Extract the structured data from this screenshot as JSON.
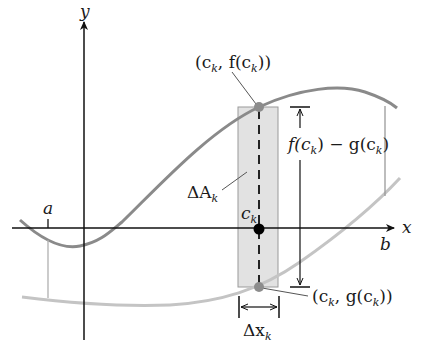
{
  "diagram": {
    "colors": {
      "axis": "#111111",
      "curve_f": "#8a8a8a",
      "curve_g": "#c4c4c4",
      "rect_fill": "#e2e2e2",
      "rect_stroke": "#9a9a9a",
      "point_gray": "#8c8c8c",
      "point_black": "#000000"
    },
    "axes": {
      "x_label": "x",
      "y_label": "y"
    },
    "labels": {
      "a": "a",
      "b": "b",
      "ck": "c",
      "ck_sub": "k",
      "delta_A": "ΔA",
      "delta_A_sub": "k",
      "delta_x": "Δx",
      "delta_x_sub": "k",
      "top_point_pre": "(c",
      "top_point_sub": "k",
      "top_point_mid": ", f(c",
      "top_point_sub2": "k",
      "top_point_post": "))",
      "bottom_point_pre": "(c",
      "bottom_point_sub": "k",
      "bottom_point_mid": ", g(c",
      "bottom_point_sub2": "k",
      "bottom_point_post": "))",
      "height_f": "f(c",
      "height_f_sub": "k",
      "height_mid": ") − g(c",
      "height_g_sub": "k",
      "height_post": ")"
    }
  }
}
